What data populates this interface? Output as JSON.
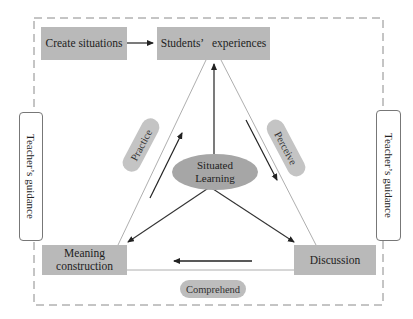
{
  "diagram": {
    "nodes": {
      "create_situations": "Create situations",
      "students_experiences": "Students’   experiences",
      "meaning_construction_line1": "Meaning",
      "meaning_construction_line2": "construction",
      "discussion": "Discussion",
      "situated_learning_line1": "Situated",
      "situated_learning_line2": "Learning"
    },
    "side_labels": {
      "left": "Teacher’s guidance",
      "right": "Teacher’s guidance"
    },
    "edge_labels": {
      "practice": "Practice",
      "perceive": "Perceive",
      "comprehend": "Comprehend"
    },
    "edges": [
      {
        "from": "Create situations",
        "to": "Students’ experiences"
      },
      {
        "from": "Situated Learning",
        "to": "Students’ experiences"
      },
      {
        "from": "Situated Learning",
        "to": "Meaning construction"
      },
      {
        "from": "Situated Learning",
        "to": "Discussion"
      },
      {
        "from": "Meaning construction",
        "to": "Students’ experiences",
        "label": "Practice"
      },
      {
        "from": "Students’ experiences",
        "to": "Discussion",
        "label": "Perceive"
      },
      {
        "from": "Discussion",
        "to": "Meaning construction",
        "label": "Comprehend"
      }
    ],
    "colors": {
      "box_fill": "#b9b9b9",
      "ellipse_fill": "#a6a6a6",
      "pill_fill": "#c4c4c4",
      "line": "#333333",
      "dashed_border": "#888888"
    }
  }
}
